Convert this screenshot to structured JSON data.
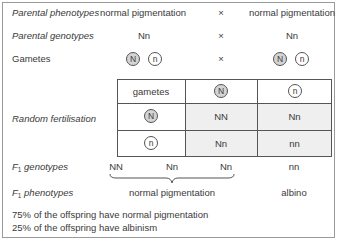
{
  "rows": {
    "parental_phenotypes": {
      "label": "Parental phenotypes",
      "left": "normal pigmentation",
      "cross": "×",
      "right": "normal pigmentation"
    },
    "parental_genotypes": {
      "label": "Parental genotypes",
      "left": "Nn",
      "cross": "×",
      "right": "Nn"
    },
    "gametes": {
      "label": "Gametes",
      "left": [
        "N",
        "n"
      ],
      "cross": "×",
      "right": [
        "N",
        "n"
      ]
    }
  },
  "punnett": {
    "label": "Random fertilisation",
    "header": "gametes",
    "col_gametes": [
      "N",
      "n"
    ],
    "row_gametes": [
      "N",
      "n"
    ],
    "cells": [
      [
        "NN",
        "Nn"
      ],
      [
        "Nn",
        "nn"
      ]
    ],
    "colors": {
      "cell_fill": "#efefef",
      "dominant_circle": "#d4d4d4"
    }
  },
  "f1": {
    "genotypes_label": "F",
    "genotypes_label_sub": "1",
    "genotypes_label_rest": " genotypes",
    "genotypes": [
      "NN",
      "Nn",
      "Nn",
      "nn"
    ],
    "phenotypes_label": "F",
    "phenotypes_label_sub": "1",
    "phenotypes_label_rest": " phenotypes",
    "phenotype_normal": "normal pigmentation",
    "phenotype_albino": "albino"
  },
  "summary": [
    "75% of the offspring have normal pigmentation",
    "25% of the offspring have albinism"
  ]
}
